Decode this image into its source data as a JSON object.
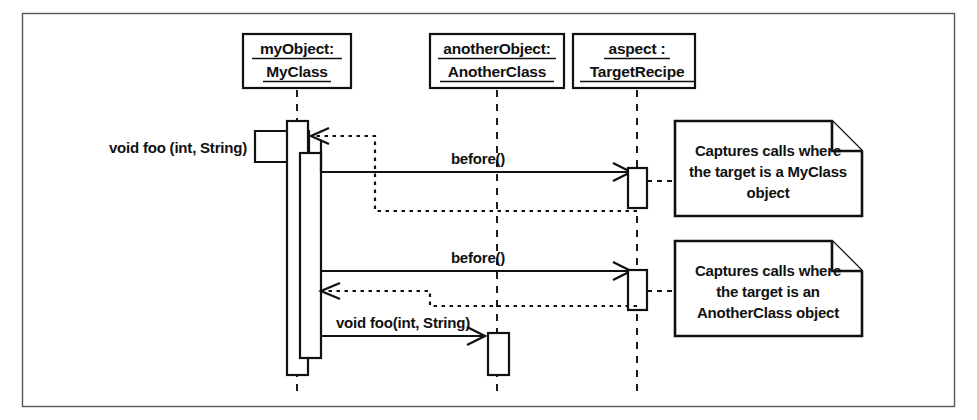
{
  "diagram": {
    "type": "uml-sequence-diagram",
    "background_color": "#ffffff",
    "line_color": "#111111",
    "frame_color": "#58585a",
    "lifelines": [
      {
        "id": "myobject",
        "name_line1": "myObject:",
        "name_line2": "MyClass",
        "x": 297
      },
      {
        "id": "anotherobject",
        "name_line1": "anotherObject:",
        "name_line2": "AnotherClass",
        "x": 497
      },
      {
        "id": "aspect",
        "name_line1": "aspect :",
        "name_line2": "TargetRecipe",
        "x": 637
      }
    ],
    "messages": [
      {
        "id": "found-call",
        "label": "void foo (int, String)",
        "kind": "found-call",
        "from": "external-left",
        "to": "myobject",
        "arrow": "solid-filled"
      },
      {
        "id": "before-1",
        "label": "before()",
        "kind": "call",
        "from": "myobject",
        "to": "aspect",
        "arrow": "open"
      },
      {
        "id": "return-1",
        "label": "",
        "kind": "return",
        "from": "aspect",
        "to": "myobject",
        "arrow": "open-dashed"
      },
      {
        "id": "before-2",
        "label": "before()",
        "kind": "call",
        "from": "myobject",
        "to": "aspect",
        "arrow": "open"
      },
      {
        "id": "return-2",
        "label": "",
        "kind": "return",
        "from": "aspect",
        "to": "myobject",
        "arrow": "open-dashed"
      },
      {
        "id": "foo-call",
        "label": "void foo(int, String)",
        "kind": "call",
        "from": "myobject",
        "to": "anotherobject",
        "arrow": "open"
      }
    ],
    "notes": [
      {
        "id": "note-myclass",
        "lines": [
          "Captures calls where",
          "the target is a MyClass",
          "object"
        ],
        "attached_to": "aspect"
      },
      {
        "id": "note-anotherclass",
        "lines": [
          "Captures calls where",
          "the target is an",
          "AnotherClass object"
        ],
        "attached_to": "aspect"
      }
    ]
  }
}
